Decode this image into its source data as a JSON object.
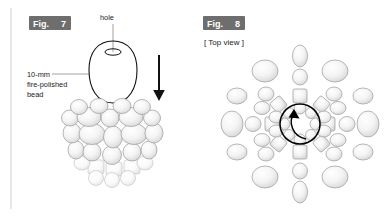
{
  "page": {
    "background_color": "#ffffff",
    "width": 388,
    "height": 217
  },
  "figure7": {
    "tag_prefix": "Fig.",
    "tag_number": "7",
    "tag_bg_color": "#6e6e6e",
    "tag_text_color": "#ffffff",
    "callouts": {
      "hole_label": "hole",
      "bead_label_line1": "10-mm",
      "bead_label_line2": "fire-polished",
      "bead_label_line3": "bead"
    },
    "icons": {
      "direction_arrow": "down-arrow-icon",
      "bead_outline": "bead-outline-icon",
      "hole": "hole-ellipse-icon",
      "bead_pile": "bead-pile-icon"
    },
    "bead_outline_color": "#111111",
    "pellet_fill_color": "#f2f2f2",
    "pellet_stroke_color": "#9a9a9a"
  },
  "figure8": {
    "tag_prefix": "Fig.",
    "tag_number": "8",
    "tag_bg_color": "#6e6e6e",
    "tag_text_color": "#ffffff",
    "view_label": "[ Top view ]",
    "icons": {
      "rotation_arrow": "rotation-arrow-icon",
      "radial_pattern": "radial-bead-pattern-icon"
    },
    "rotation_arrow_color": "#000000",
    "pellet_fill_color": "#f2f2f2",
    "pellet_stroke_color": "#9a9a9a"
  }
}
